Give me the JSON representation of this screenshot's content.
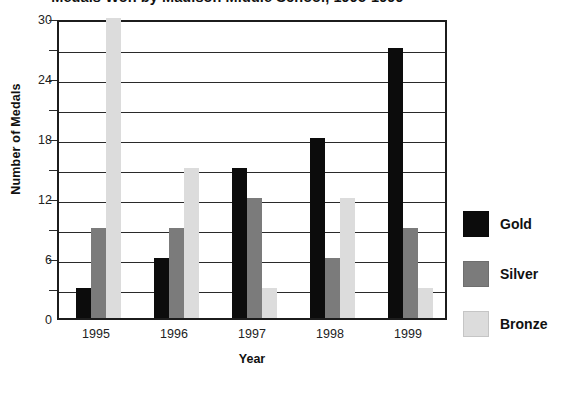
{
  "chart_data": {
    "type": "bar",
    "title": "Medals Won by Madison Middle School, 1995-1999",
    "xlabel": "Year",
    "ylabel": "Number of Medals",
    "categories": [
      "1995",
      "1996",
      "1997",
      "1998",
      "1999"
    ],
    "series": [
      {
        "name": "Gold",
        "color": "#0c0c0c",
        "values": [
          3,
          6,
          15,
          18,
          27
        ]
      },
      {
        "name": "Silver",
        "color": "#7b7b7b",
        "values": [
          9,
          9,
          12,
          6,
          9
        ]
      },
      {
        "name": "Bronze",
        "color": "#dcdcdc",
        "values": [
          30,
          15,
          3,
          12,
          3
        ]
      }
    ],
    "ylim": [
      0,
      30
    ],
    "yticks": [
      "0",
      "6",
      "12",
      "18",
      "24",
      "30"
    ],
    "ytick_values": [
      0,
      6,
      12,
      18,
      24,
      30
    ],
    "gridline_values": [
      3,
      6,
      9,
      12,
      15,
      18,
      21,
      24,
      27,
      30
    ],
    "grid": true,
    "legend_position": "right",
    "legend": [
      "Gold",
      "Silver",
      "Bronze"
    ]
  }
}
